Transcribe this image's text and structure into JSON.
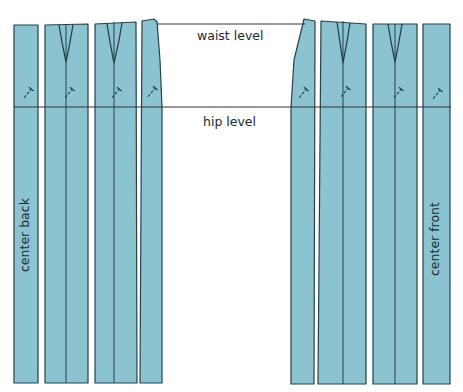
{
  "colors": {
    "fill": "#8cc3d0",
    "stroke": "#23424d",
    "guide": "#333333",
    "background": "#ffffff"
  },
  "labels": {
    "waist": "waist level",
    "hip": "hip level",
    "center_back": "center back",
    "center_front": "center front"
  },
  "guides": {
    "waist_y": 24,
    "hip_y": 107,
    "x_start": 14,
    "x_end": 451
  },
  "pieces": [
    {
      "id": "back-1",
      "points": "14,25 38,25 38,383 14,383"
    },
    {
      "id": "back-2",
      "points": "45,25 88,24 88,383 45,383",
      "split_x": 66,
      "dart": {
        "left": [
          59,
          25
        ],
        "right": [
          73,
          25
        ],
        "apex": [
          66,
          62
        ]
      }
    },
    {
      "id": "back-3",
      "points": "95,24 136,22 137,383 95,383",
      "split_x": 114,
      "dart": {
        "left": [
          107,
          24
        ],
        "right": [
          122,
          23
        ],
        "apex": [
          114,
          63
        ]
      }
    },
    {
      "id": "back-4",
      "points": "142,21 154,19 157,22 160,60 162,107 162,383 140,383"
    },
    {
      "id": "front-5",
      "points": "304,19 315,21 314,384 291,384 291,107 294,60"
    },
    {
      "id": "front-6",
      "points": "321,21 366,24 366,384 318,384",
      "split_x": 343,
      "dart": {
        "left": [
          337,
          22
        ],
        "right": [
          350,
          23
        ],
        "apex": [
          343,
          63
        ]
      }
    },
    {
      "id": "front-7",
      "points": "373,24 417,24 417,384 373,384",
      "split_x": 395,
      "dart": {
        "left": [
          388,
          24
        ],
        "right": [
          402,
          24
        ],
        "apex": [
          395,
          62
        ]
      }
    },
    {
      "id": "front-8",
      "points": "423,24 450,24 450,384 423,384"
    }
  ],
  "grainlines": [
    {
      "x": 28,
      "y": 93
    },
    {
      "x": 69,
      "y": 93
    },
    {
      "x": 116,
      "y": 93
    },
    {
      "x": 152,
      "y": 92
    },
    {
      "x": 303,
      "y": 93
    },
    {
      "x": 345,
      "y": 92
    },
    {
      "x": 398,
      "y": 93
    },
    {
      "x": 437,
      "y": 94
    }
  ]
}
